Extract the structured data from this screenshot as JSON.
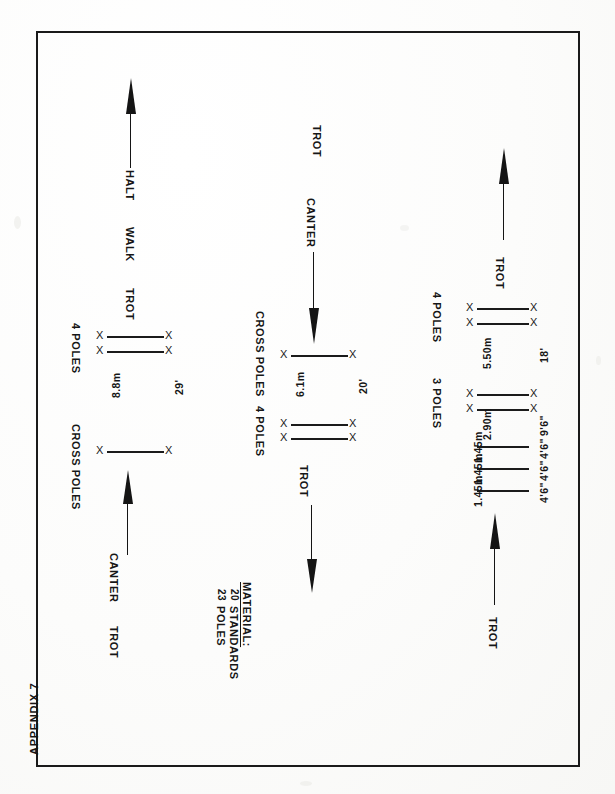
{
  "document": {
    "appendix_label": "APPENDIX 7",
    "page_background": "#fdfdfc",
    "ink_color": "#1a1a1a"
  },
  "material": {
    "heading": "MATERIAL:",
    "lines": [
      {
        "count": "20",
        "item": "STANDARDS"
      },
      {
        "count": "23",
        "item": "POLES"
      }
    ]
  },
  "lanes": [
    {
      "id": "lane-left",
      "name": "left-lane",
      "gaits_top": [
        "HALT",
        "WALK",
        "TROT"
      ],
      "gaits_bottom": [
        "CANTER",
        "TROT"
      ],
      "obstacles": [
        {
          "label": "4 POLES",
          "poles": 2,
          "has_standards": true
        },
        {
          "label": "CROSS POLES",
          "poles": 1,
          "has_standards": true
        }
      ],
      "distances": [
        {
          "metric": "8.8m",
          "imperial": "29'"
        }
      ],
      "arrows": [
        {
          "name": "halt-arrow-up",
          "direction": "up"
        },
        {
          "name": "canter-arrow-up",
          "direction": "up"
        }
      ]
    },
    {
      "id": "lane-middle",
      "name": "middle-lane",
      "gaits_top": [
        "TROT",
        "CANTER"
      ],
      "gaits_bottom": [
        "TROT"
      ],
      "obstacles": [
        {
          "label": "CROSS POLES",
          "poles": 1,
          "has_standards": true
        },
        {
          "label": "4 POLES",
          "poles": 2,
          "has_standards": true
        }
      ],
      "distances": [
        {
          "metric": "6.1m",
          "imperial": "20'"
        }
      ],
      "arrows": [
        {
          "name": "canter-arrow-down",
          "direction": "down"
        },
        {
          "name": "trot-arrow-down",
          "direction": "down"
        }
      ]
    },
    {
      "id": "lane-right",
      "name": "right-lane",
      "gaits_top": [
        "TROT"
      ],
      "gaits_bottom": [
        "TROT"
      ],
      "obstacles": [
        {
          "label": "4 POLES",
          "poles": 2,
          "has_standards": true
        },
        {
          "label": "3 POLES",
          "poles": 2,
          "has_standards": true
        },
        {
          "label": "",
          "poles": 1,
          "has_standards": false
        },
        {
          "label": "",
          "poles": 1,
          "has_standards": false
        },
        {
          "label": "",
          "poles": 1,
          "has_standards": false
        }
      ],
      "distances": [
        {
          "metric": "5.50m",
          "imperial": "18'"
        },
        {
          "metric": "2.90m",
          "imperial": "9'6\""
        },
        {
          "metric": "1.45m",
          "imperial": "4'6\""
        },
        {
          "metric": "1.45m",
          "imperial": "4'6\""
        },
        {
          "metric": "1.45m",
          "imperial": "4'6\""
        }
      ],
      "arrows": [
        {
          "name": "trot-arrow-up-top",
          "direction": "up"
        },
        {
          "name": "trot-arrow-up-bottom",
          "direction": "up"
        }
      ]
    }
  ],
  "labels": {
    "halt": "HALT",
    "walk": "WALK",
    "trot": "TROT",
    "canter": "CANTER",
    "four_poles": "4 POLES",
    "three_poles": "3 POLES",
    "cross_poles": "CROSS POLES",
    "standard_mark": "X",
    "d_8_8m": "8.8m",
    "d_29ft": "29'",
    "d_6_1m": "6.1m",
    "d_20ft": "20'",
    "d_5_50m": "5.50m",
    "d_18ft": "18'",
    "d_2_90m": "2.90m",
    "d_9ft6": "9'6\"",
    "d_1_45m_a": "1.45m",
    "d_4ft6_a": "4'6\"",
    "d_1_45m_b": "1.45m",
    "d_4ft6_b": "4'6\"",
    "d_1_45m_c": "1.45m",
    "d_4ft6_c": "4'6\"",
    "material_heading": "MATERIAL:",
    "mat_20": "20",
    "mat_standards": "STANDARDS",
    "mat_23": "23",
    "mat_poles": "POLES",
    "appendix": "APPENDIX 7"
  }
}
